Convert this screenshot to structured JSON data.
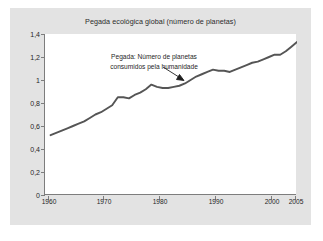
{
  "figure": {
    "title": "Pegada ecológica global (número de planetas)",
    "background_color": "#e3e3e3",
    "plot_background_color": "#ffffff",
    "axis_color": "#7d7d7d",
    "line_color": "#555555",
    "text_color": "#1f1f1f"
  },
  "annotation": {
    "line1": "Pegada: Número de planetas",
    "line2": "consumidos pela humanidade",
    "points_to_year": 1986,
    "points_to_value": 1.03
  },
  "axes": {
    "y_tick_labels": [
      "1,4",
      "1,2",
      "1",
      "0,8",
      "0,6",
      "0,4",
      "0,2",
      "0"
    ],
    "y_tick_values": [
      1.4,
      1.2,
      1.0,
      0.8,
      0.6,
      0.4,
      0.2,
      0
    ],
    "x_tick_labels": [
      "1960",
      "1970",
      "1980",
      "1990",
      "2000",
      "2005"
    ],
    "x_tick_values": [
      1960,
      1970,
      1980,
      1990,
      2000,
      2005
    ]
  },
  "chart_data": {
    "type": "line",
    "title": "Pegada ecológica global (número de planetas)",
    "xlabel": "",
    "ylabel": "",
    "xlim": [
      1960,
      2005
    ],
    "ylim": [
      0,
      1.4
    ],
    "grid": false,
    "legend": null,
    "series": [
      {
        "name": "Pegada: Número de planetas consumidos pela humanidade",
        "color": "#555555",
        "x": [
          1961,
          1962,
          1963,
          1964,
          1965,
          1966,
          1967,
          1968,
          1969,
          1970,
          1971,
          1972,
          1973,
          1974,
          1975,
          1976,
          1977,
          1978,
          1979,
          1980,
          1981,
          1982,
          1983,
          1984,
          1985,
          1986,
          1987,
          1988,
          1989,
          1990,
          1991,
          1992,
          1993,
          1994,
          1995,
          1996,
          1997,
          1998,
          1999,
          2000,
          2001,
          2002,
          2003,
          2004,
          2005
        ],
        "y": [
          0.52,
          0.54,
          0.56,
          0.58,
          0.6,
          0.62,
          0.64,
          0.67,
          0.7,
          0.72,
          0.75,
          0.78,
          0.85,
          0.85,
          0.84,
          0.87,
          0.89,
          0.92,
          0.96,
          0.94,
          0.93,
          0.93,
          0.94,
          0.95,
          0.97,
          1.0,
          1.03,
          1.05,
          1.07,
          1.09,
          1.08,
          1.08,
          1.07,
          1.09,
          1.11,
          1.13,
          1.15,
          1.16,
          1.18,
          1.2,
          1.22,
          1.22,
          1.25,
          1.29,
          1.33
        ]
      }
    ],
    "annotations": [
      {
        "text": "Pegada: Número de planetas consumidos pela humanidade",
        "x": 1986,
        "y": 1.03,
        "arrow": true
      }
    ]
  }
}
